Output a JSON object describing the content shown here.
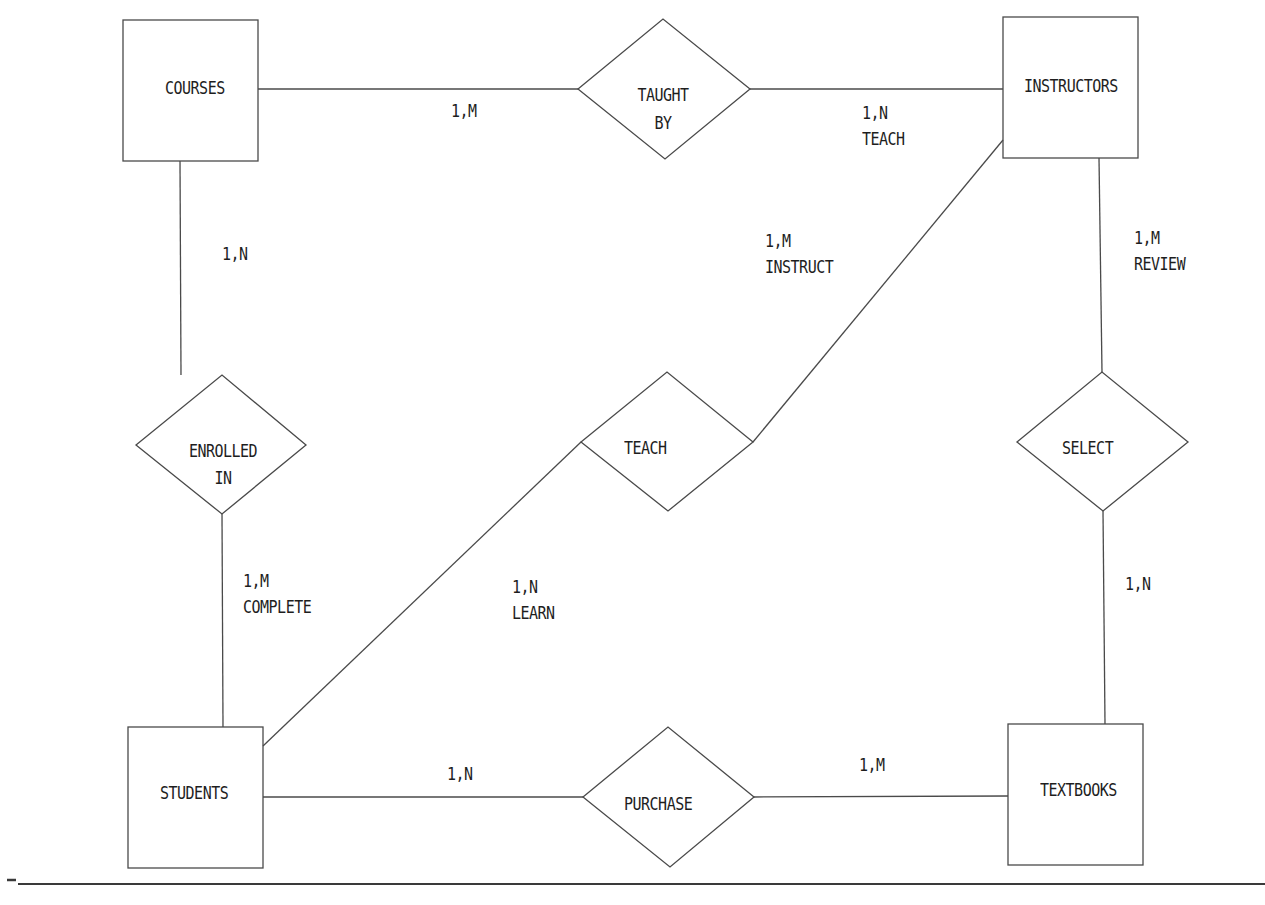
{
  "diagram": {
    "type": "entity-relationship",
    "colors": {
      "stroke": "#4a4a4a",
      "text": "#1e1e1e",
      "background": "#ffffff"
    },
    "entities": [
      {
        "id": "courses",
        "label": "COURSES"
      },
      {
        "id": "instructors",
        "label": "INSTRUCTORS"
      },
      {
        "id": "students",
        "label": "STUDENTS"
      },
      {
        "id": "textbooks",
        "label": "TEXTBOOKS"
      }
    ],
    "relationships": [
      {
        "id": "taught_by",
        "line1": "TAUGHT",
        "line2": "BY"
      },
      {
        "id": "enrolled_in",
        "line1": "ENROLLED",
        "line2": "IN"
      },
      {
        "id": "teach",
        "line1": "TEACH"
      },
      {
        "id": "select",
        "line1": "SELECT"
      },
      {
        "id": "purchase",
        "line1": "PURCHASE"
      }
    ],
    "cardinalities": {
      "courses_taught_by": {
        "value": "1,M"
      },
      "taught_by_instructors": {
        "value": "1,N",
        "role": "TEACH"
      },
      "courses_enrolled_in": {
        "value": "1,N"
      },
      "enrolled_in_students": {
        "value": "1,M",
        "role": "COMPLETE"
      },
      "instructors_teach": {
        "value": "1,M",
        "role": "INSTRUCT"
      },
      "teach_students": {
        "value": "1,N",
        "role": "LEARN"
      },
      "instructors_select": {
        "value": "1,M",
        "role": "REVIEW"
      },
      "select_textbooks": {
        "value": "1,N"
      },
      "students_purchase": {
        "value": "1,N"
      },
      "purchase_textbooks": {
        "value": "1,M"
      }
    }
  }
}
